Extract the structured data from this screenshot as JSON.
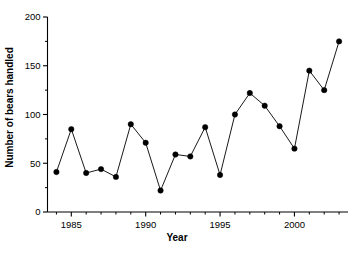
{
  "chart_data": {
    "type": "line",
    "title": "",
    "xlabel": "Year",
    "ylabel": "Number of bears handled",
    "x": [
      1984,
      1985,
      1986,
      1987,
      1988,
      1989,
      1990,
      1991,
      1992,
      1993,
      1994,
      1995,
      1996,
      1997,
      1998,
      1999,
      2000,
      2001,
      2002,
      2003
    ],
    "values": [
      41,
      85,
      40,
      44,
      36,
      90,
      71,
      22,
      59,
      57,
      87,
      38,
      100,
      122,
      109,
      88,
      65,
      145,
      125,
      175
    ],
    "series": [
      {
        "name": "Bears handled",
        "values": [
          41,
          85,
          40,
          44,
          36,
          90,
          71,
          22,
          59,
          57,
          87,
          38,
          100,
          122,
          109,
          88,
          65,
          145,
          125,
          175
        ]
      }
    ],
    "xlim": [
      1983.4,
      2003.6
    ],
    "ylim": [
      0,
      200
    ],
    "xticks": [
      1985,
      1990,
      1995,
      2000
    ],
    "xtick_labels": [
      "1985",
      "1990",
      "1995",
      "2000"
    ],
    "xticks_minor": [
      1984,
      1986,
      1987,
      1988,
      1989,
      1991,
      1992,
      1993,
      1994,
      1996,
      1997,
      1998,
      1999,
      2001,
      2002,
      2003
    ],
    "yticks": [
      0,
      50,
      100,
      150,
      200
    ],
    "ytick_labels": [
      "0",
      "50",
      "100",
      "150",
      "200"
    ],
    "yticks_minor": [
      25,
      75,
      125,
      175
    ],
    "grid": false,
    "legend": false,
    "marker": "filled-circle",
    "line_color": "#000000",
    "marker_color": "#000000",
    "axis_color": "#000000",
    "background": "#ffffff"
  }
}
